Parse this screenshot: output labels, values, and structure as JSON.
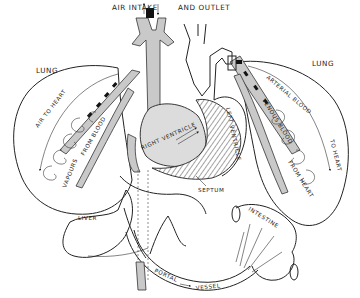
{
  "diagram": {
    "type": "anatomical-line-drawing",
    "labels": {
      "air_intake": "AIR INTAKE",
      "and_outlet": "AND OUTLET",
      "lung_left": "LUNG",
      "lung_right": "LUNG",
      "air_to_heart": "AIR TO HEART",
      "vapours": "VAPOURS",
      "from_blood": "FROM BLOOD",
      "arterial_blood": "ARTERIAL BLOOD",
      "to_heart": "TO HEART",
      "venous_blood": "VENOUS BLOOD",
      "from_heart": "FROM HEART",
      "left_ventricle": "LEFT VENTRICLE",
      "right_ventricle": "RIGHT VENTRICLE",
      "septum": "SEPTUM",
      "liver": "LIVER",
      "intestine": "INTESTINE",
      "portal": "PORTAL",
      "vessel": "VESSEL"
    },
    "colors": {
      "line": "#222222",
      "vessel_fill": "#c9c9c9",
      "stipple_fill": "#dcdcdc",
      "background": "#ffffff"
    }
  }
}
